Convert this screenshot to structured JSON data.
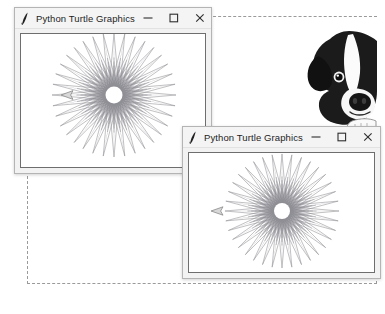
{
  "page": {
    "background_color": "#ffffff",
    "border_style": "dashed",
    "border_color": "#9a9a9a"
  },
  "windows": [
    {
      "id": "window-1",
      "title": "Python Turtle Graphics",
      "icon": "python-turtle-feather-icon",
      "controls": {
        "minimize_label": "–",
        "maximize_label": "□",
        "close_label": "×"
      },
      "canvas": {
        "background_color": "#ffffff",
        "border_color": "#6e6e6e",
        "turtle_cursor": "arrow-left"
      }
    },
    {
      "id": "window-2",
      "title": "Python Turtle Graphics",
      "icon": "python-turtle-feather-icon",
      "controls": {
        "minimize_label": "–",
        "maximize_label": "□",
        "close_label": "×"
      },
      "canvas": {
        "background_color": "#ffffff",
        "border_color": "#6e6e6e",
        "turtle_cursor": "arrow-left"
      }
    }
  ],
  "decoration": {
    "dog_photo": {
      "name": "french-bulldog-photo",
      "description": "black and white french bulldog peeking",
      "colors": {
        "fur_dark": "#1b1b1b",
        "fur_light": "#fdfdfd",
        "shadow": "#7a7a7a"
      }
    }
  },
  "chart_data": {
    "type": "line",
    "spokes": 36,
    "angle_step_degrees": 170,
    "radius": 62,
    "inner_radius": 9,
    "stroke_color": "#8d8d93",
    "stroke_width": 0.55,
    "grid": false,
    "legend": false,
    "xlabel": "",
    "ylabel": ""
  }
}
